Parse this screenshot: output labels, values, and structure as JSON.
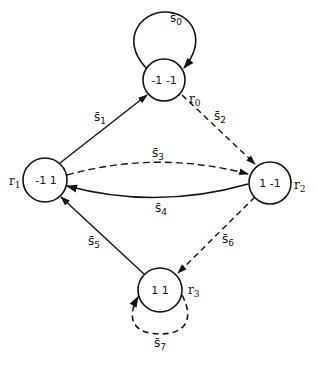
{
  "diagram": {
    "type": "state-transition-graph",
    "line_color": "#111111",
    "background": "#ffffff",
    "nodes": [
      {
        "id": "r0",
        "state": "r",
        "sub": "0",
        "value": "-1 -1"
      },
      {
        "id": "r1",
        "state": "r",
        "sub": "1",
        "value": "-1 1"
      },
      {
        "id": "r2",
        "state": "r",
        "sub": "2",
        "value": "1 -1"
      },
      {
        "id": "r3",
        "state": "r",
        "sub": "3",
        "value": "1 1"
      }
    ],
    "edges": [
      {
        "id": "s0",
        "sym": "s̄",
        "sub": "0",
        "from": "r0",
        "to": "r0",
        "style": "solid",
        "kind": "self-loop"
      },
      {
        "id": "s1",
        "sym": "s̄",
        "sub": "1",
        "from": "r1",
        "to": "r0",
        "style": "solid"
      },
      {
        "id": "s2",
        "sym": "s̄",
        "sub": "2",
        "from": "r0",
        "to": "r2",
        "style": "dashed"
      },
      {
        "id": "s3",
        "sym": "s̄",
        "sub": "3",
        "from": "r1",
        "to": "r2",
        "style": "dashed"
      },
      {
        "id": "s4",
        "sym": "s̄",
        "sub": "4",
        "from": "r2",
        "to": "r1",
        "style": "solid"
      },
      {
        "id": "s5",
        "sym": "s̄",
        "sub": "5",
        "from": "r3",
        "to": "r1",
        "style": "solid"
      },
      {
        "id": "s6",
        "sym": "s̄",
        "sub": "6",
        "from": "r2",
        "to": "r3",
        "style": "dashed"
      },
      {
        "id": "s7",
        "sym": "s̄",
        "sub": "7",
        "from": "r3",
        "to": "r3",
        "style": "dashed",
        "kind": "self-loop"
      }
    ]
  }
}
